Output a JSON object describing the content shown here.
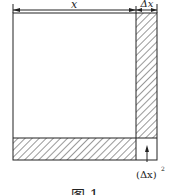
{
  "figure": {
    "labels": {
      "x": "x",
      "dx": "Δx",
      "dx_squared": "(Δx)",
      "dx_squared_exp": "2",
      "caption_partial": "图 1"
    },
    "colors": {
      "stroke": "#222222",
      "background": "#ffffff"
    }
  }
}
